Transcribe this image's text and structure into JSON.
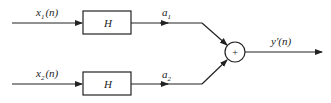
{
  "diagram": {
    "inputs": [
      {
        "label": "x",
        "sub": "1",
        "arg": "(n)"
      },
      {
        "label": "x",
        "sub": "2",
        "arg": "(n)"
      }
    ],
    "blocks": [
      {
        "label": "H"
      },
      {
        "label": "H"
      }
    ],
    "gains": [
      {
        "label": "a",
        "sub": "1"
      },
      {
        "label": "a",
        "sub": "2"
      }
    ],
    "summer": {
      "symbol": "+"
    },
    "output": {
      "label": "y′(n)"
    },
    "colors": {
      "line": "#222222",
      "background": "#ffffff"
    }
  }
}
